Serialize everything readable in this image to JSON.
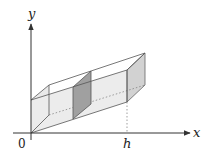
{
  "diagram": {
    "title": "",
    "axes": {
      "x_label": "x",
      "y_label": "y",
      "origin_label": "0",
      "x_tick_label": "h"
    },
    "colors": {
      "face_fill": "#e6e6e6",
      "end_face_fill": "#cfcfcf",
      "slice_fill": "#9a9a9a",
      "edge": "#555555",
      "axis": "#333333"
    }
  }
}
